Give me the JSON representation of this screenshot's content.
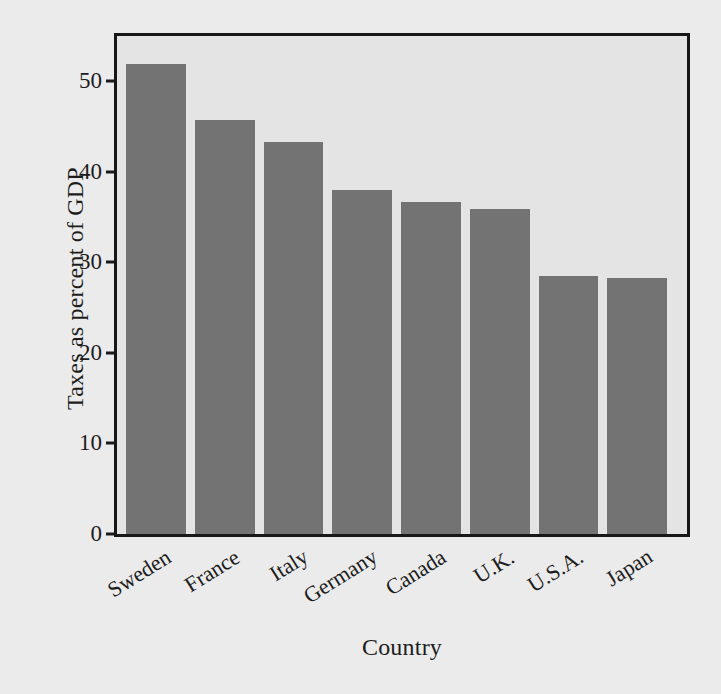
{
  "chart_data": {
    "type": "bar",
    "title": "",
    "subtitle": "",
    "xlabel": "Country",
    "ylabel": "Taxes as percent of GDP",
    "categories": [
      "Sweden",
      "France",
      "Italy",
      "Germany",
      "Canada",
      "U.K.",
      "U.S.A.",
      "Japan"
    ],
    "values": [
      51.9,
      45.7,
      43.3,
      38.0,
      36.7,
      35.9,
      28.5,
      28.3
    ],
    "ylim": [
      0,
      55
    ],
    "yticks": [
      0,
      10,
      20,
      30,
      40,
      50
    ],
    "ytick_labels": [
      "0",
      "10",
      "20",
      "30",
      "40",
      "50"
    ],
    "grid": false,
    "legend": "none",
    "bar_color": "#737373",
    "plot_background": "#e4e4e4",
    "figure_background": "#ebebeb",
    "axis_color": "#171717",
    "xtick_rotation": -32
  },
  "axes": {
    "y_title": "Taxes as percent of GDP",
    "x_title": "Country"
  }
}
